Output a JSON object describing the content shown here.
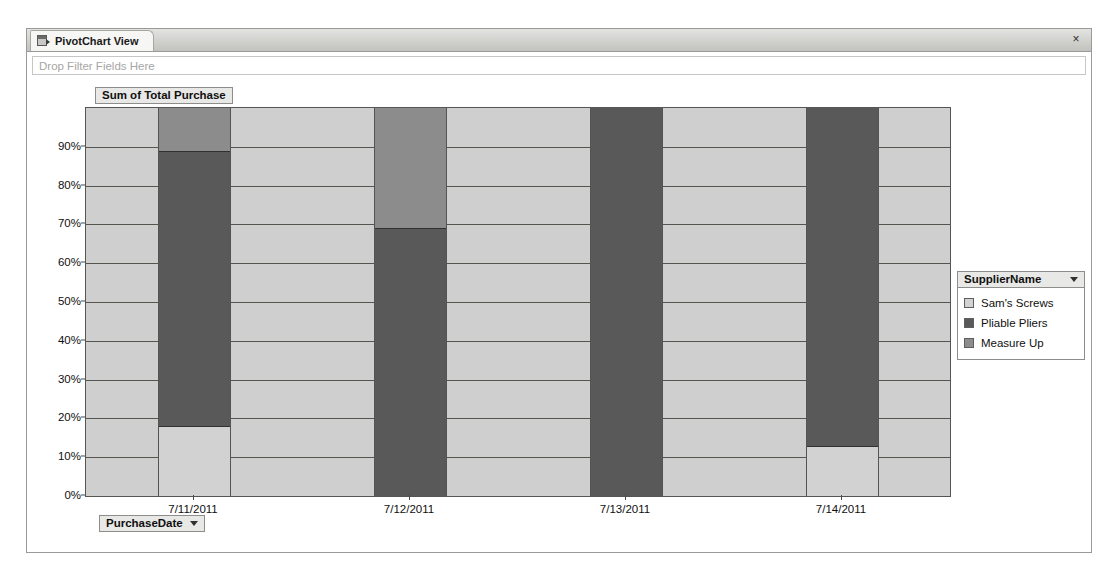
{
  "window": {
    "tab_label": "PivotChart View",
    "tab_icon": "pivotchart-view-icon",
    "close_label": "×"
  },
  "filter_zone": {
    "placeholder": "Drop Filter Fields Here"
  },
  "chart_title": "Sum of Total Purchase",
  "category_field_button": {
    "label": "PurchaseDate",
    "caret": "▾"
  },
  "legend": {
    "title": "SupplierName",
    "caret": "▾",
    "items": [
      {
        "label": "Sam's Screws",
        "color": "#d2d2d2"
      },
      {
        "label": "Pliable Pliers",
        "color": "#595959"
      },
      {
        "label": "Measure Up",
        "color": "#8c8c8c"
      }
    ]
  },
  "chart_data": {
    "type": "bar",
    "stacked": true,
    "stack_mode": "percent",
    "title": "Sum of Total Purchase",
    "xlabel": "PurchaseDate",
    "ylabel": "",
    "grid": true,
    "legend_position": "right",
    "ylim": [
      0,
      100
    ],
    "yticks": [
      0,
      10,
      20,
      30,
      40,
      50,
      60,
      70,
      80,
      90
    ],
    "ytick_labels": [
      "0%",
      "10%",
      "20%",
      "30%",
      "40%",
      "50%",
      "60%",
      "70%",
      "80%",
      "90%"
    ],
    "categories": [
      "7/11/2011",
      "7/12/2011",
      "7/13/2011",
      "7/14/2011"
    ],
    "series": [
      {
        "name": "Sam's Screws",
        "color": "#d2d2d2",
        "values": [
          18,
          0,
          0,
          13
        ]
      },
      {
        "name": "Pliable Pliers",
        "color": "#595959",
        "values": [
          71,
          69,
          100,
          87
        ]
      },
      {
        "name": "Measure Up",
        "color": "#8c8c8c",
        "values": [
          11,
          31,
          0,
          0
        ]
      }
    ]
  }
}
